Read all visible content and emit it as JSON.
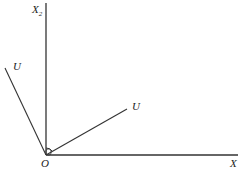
{
  "diagram": {
    "axis_vertical_label": "X",
    "axis_vertical_subscript": "2",
    "axis_horizontal_label": "X",
    "origin_label": "O",
    "vector_left_label": "U",
    "vector_right_label": "U",
    "line_color": "#333333"
  }
}
